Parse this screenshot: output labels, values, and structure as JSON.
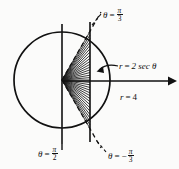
{
  "figure": {
    "background_color": "#fbfbfa",
    "ink_color": "#111111"
  },
  "geometry": {
    "circle": {
      "cx": 62,
      "cy": 80,
      "r": 48,
      "label": "r = 4"
    },
    "vertical_line_secant": {
      "x": 90,
      "y_top": 22,
      "y_bottom": 142,
      "label": "r = 2 sec theta"
    },
    "vertical_line_axis": {
      "x": 62,
      "y_top": 24,
      "y_bottom": 144,
      "label": "theta = pi/2"
    },
    "polar_axis": {
      "x_start": 62,
      "x_end": 173,
      "y": 81,
      "arrow": true
    },
    "ray_upper": {
      "angle_deg": 60,
      "style": "dashed",
      "label": "theta = pi/3"
    },
    "ray_lower": {
      "angle_deg": -60,
      "style": "dashed",
      "label": "theta = -pi/3"
    },
    "fan": {
      "ray_count": 29,
      "angle_from_deg": -60,
      "angle_to_deg": 60,
      "origin_x": 62,
      "origin_y": 80,
      "terminates_at_x": 90
    }
  },
  "labels": {
    "theta_pi_over_3": {
      "theta": "θ",
      "equals": "=",
      "numerator": "π",
      "denominator": "3",
      "negative": ""
    },
    "r_2_sec_theta": {
      "text": "r = 2 sec θ",
      "r": "r",
      "equals": "=",
      "expr": "2 sec θ"
    },
    "r_4": {
      "text": "r = 4",
      "r": "r",
      "equals": "=",
      "value": "4"
    },
    "theta_pi_over_2": {
      "theta": "θ",
      "equals": "=",
      "numerator": "π",
      "denominator": "2",
      "negative": ""
    },
    "theta_neg_pi_over_3": {
      "theta": "θ",
      "equals": "=",
      "numerator": "π",
      "denominator": "3",
      "negative": "−"
    }
  }
}
